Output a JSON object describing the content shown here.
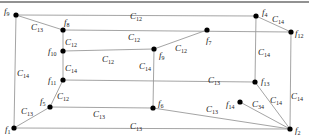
{
  "diagram": {
    "type": "graph",
    "border_top": {
      "x1": 0,
      "y1": 2,
      "x2": 309,
      "y2": 2
    },
    "nodes": [
      {
        "id": "f9",
        "label": "f",
        "sub": "9",
        "x": 16,
        "y": 15,
        "lx": 4,
        "ly": 14
      },
      {
        "id": "f8",
        "label": "f",
        "sub": "8",
        "x": 63,
        "y": 30,
        "lx": 64,
        "ly": 25
      },
      {
        "id": "f10",
        "label": "f",
        "sub": "10",
        "x": 63,
        "y": 51,
        "lx": 48,
        "ly": 54
      },
      {
        "id": "f11",
        "label": "f",
        "sub": "11",
        "x": 63,
        "y": 80,
        "lx": 48,
        "ly": 83
      },
      {
        "id": "f5",
        "label": "f",
        "sub": "5",
        "x": 50,
        "y": 107,
        "lx": 40,
        "ly": 104
      },
      {
        "id": "f1",
        "label": "f",
        "sub": "1",
        "x": 14,
        "y": 128,
        "lx": 5,
        "ly": 132
      },
      {
        "id": "f4",
        "label": "f",
        "sub": "4",
        "x": 256,
        "y": 16,
        "lx": 262,
        "ly": 15
      },
      {
        "id": "f12",
        "label": "f",
        "sub": "12",
        "x": 291,
        "y": 32,
        "lx": 295,
        "ly": 36
      },
      {
        "id": "f7",
        "label": "f",
        "sub": "7",
        "x": 207,
        "y": 30,
        "lx": 206,
        "ly": 43
      },
      {
        "id": "f9b",
        "label": "f",
        "sub": "9",
        "x": 154,
        "y": 49,
        "lx": 159,
        "ly": 58
      },
      {
        "id": "f6",
        "label": "f",
        "sub": "6",
        "x": 153,
        "y": 108,
        "lx": 158,
        "ly": 106
      },
      {
        "id": "f13",
        "label": "f",
        "sub": "13",
        "x": 255,
        "y": 82,
        "lx": 261,
        "ly": 84
      },
      {
        "id": "f14",
        "label": "f",
        "sub": "14",
        "x": 240,
        "y": 102,
        "lx": 226,
        "ly": 107
      },
      {
        "id": "f2",
        "label": "f",
        "sub": "2",
        "x": 290,
        "y": 129,
        "lx": 295,
        "ly": 133
      }
    ],
    "edges": [
      {
        "from": [
          16,
          15
        ],
        "to": [
          256,
          16
        ],
        "label": "C",
        "sub": "12",
        "lx": 130,
        "ly": 19
      },
      {
        "from": [
          16,
          15
        ],
        "to": [
          63,
          30
        ],
        "label": "C",
        "sub": "13",
        "lx": 31,
        "ly": 30
      },
      {
        "from": [
          63,
          30
        ],
        "to": [
          291,
          32
        ],
        "label": "C",
        "sub": "12",
        "lx": 128,
        "ly": 40
      },
      {
        "from": [
          63,
          30
        ],
        "to": [
          63,
          51
        ],
        "label": "C",
        "sub": "12",
        "lx": 65,
        "ly": 45
      },
      {
        "from": [
          63,
          51
        ],
        "to": [
          154,
          49
        ],
        "label": "C",
        "sub": "12",
        "lx": 102,
        "ly": 62
      },
      {
        "from": [
          63,
          51
        ],
        "to": [
          63,
          80
        ],
        "label": "C",
        "sub": "14",
        "lx": 65,
        "ly": 71
      },
      {
        "from": [
          154,
          49
        ],
        "to": [
          207,
          30
        ],
        "label": "C",
        "sub": "12",
        "lx": 175,
        "ly": 51
      },
      {
        "from": [
          154,
          49
        ],
        "to": [
          153,
          108
        ],
        "label": "C",
        "sub": "14",
        "lx": 139,
        "ly": 69
      },
      {
        "from": [
          256,
          16
        ],
        "to": [
          291,
          32
        ],
        "label": "C",
        "sub": "14",
        "lx": 272,
        "ly": 22
      },
      {
        "from": [
          256,
          16
        ],
        "to": [
          255,
          82
        ],
        "label": "C",
        "sub": "14",
        "lx": 258,
        "ly": 55
      },
      {
        "from": [
          291,
          32
        ],
        "to": [
          290,
          129
        ],
        "label": "C",
        "sub": "14",
        "lx": 291,
        "ly": 99
      },
      {
        "from": [
          63,
          80
        ],
        "to": [
          255,
          82
        ],
        "label": "C",
        "sub": "13",
        "lx": 208,
        "ly": 83
      },
      {
        "from": [
          63,
          80
        ],
        "to": [
          50,
          107
        ],
        "label": "C",
        "sub": "12",
        "lx": 57,
        "ly": 99
      },
      {
        "from": [
          50,
          107
        ],
        "to": [
          153,
          108
        ],
        "label": "C",
        "sub": "13",
        "lx": 93,
        "ly": 117
      },
      {
        "from": [
          153,
          108
        ],
        "to": [
          290,
          129
        ],
        "label": "C",
        "sub": "13",
        "lx": 206,
        "ly": 112
      },
      {
        "from": [
          50,
          107
        ],
        "to": [
          14,
          128
        ],
        "label": "C",
        "sub": "13",
        "lx": 21,
        "ly": 114
      },
      {
        "from": [
          14,
          128
        ],
        "to": [
          290,
          129
        ],
        "label": "C",
        "sub": "13",
        "lx": 130,
        "ly": 129
      },
      {
        "from": [
          16,
          15
        ],
        "to": [
          14,
          128
        ],
        "label": "C",
        "sub": "14",
        "lx": 17,
        "ly": 76
      },
      {
        "from": [
          255,
          82
        ],
        "to": [
          290,
          129
        ],
        "label": "C",
        "sub": "14",
        "lx": 270,
        "ly": 103
      },
      {
        "from": [
          240,
          102
        ],
        "to": [
          290,
          129
        ],
        "label": "C",
        "sub": "34",
        "lx": 252,
        "ly": 107
      }
    ]
  },
  "colors": {
    "edge": "#9a9a9a",
    "node": "#000000",
    "text": "#222222",
    "border": "#6e6e6e"
  }
}
